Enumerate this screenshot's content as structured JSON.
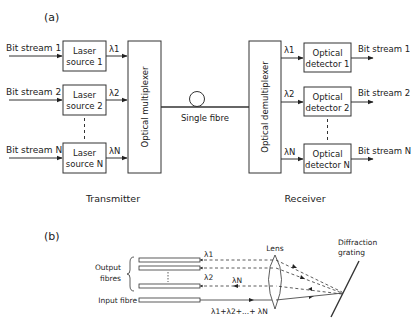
{
  "part_a": {
    "label": "(a)",
    "transmitter": {
      "caption": "Transmitter",
      "inputs": [
        "Bit stream 1",
        "Bit stream 2",
        "Bit stream N"
      ],
      "sources": [
        {
          "line1": "Laser",
          "line2": "source 1",
          "wavelength": "λ1"
        },
        {
          "line1": "Laser",
          "line2": "source 2",
          "wavelength": "λ2"
        },
        {
          "line1": "Laser",
          "line2": "source N",
          "wavelength": "λN"
        }
      ],
      "multiplexer": "Optical multiplexer"
    },
    "link": {
      "label": "Single fibre"
    },
    "receiver": {
      "caption": "Receiver",
      "demultiplexer": "Optical demultiplexer",
      "detectors": [
        {
          "line1": "Optical",
          "line2": "detector 1",
          "wavelength": "λ1"
        },
        {
          "line1": "Optical",
          "line2": "detector 2",
          "wavelength": "λ2"
        },
        {
          "line1": "Optical",
          "line2": "detector N",
          "wavelength": "λN"
        }
      ],
      "outputs": [
        "Bit stream 1",
        "Bit stream 2",
        "Bit stream N"
      ]
    }
  },
  "part_b": {
    "label": "(b)",
    "output_fibres": "Output fibres",
    "output_fibres_line1": "Output",
    "output_fibres_line2": "fibres",
    "input_fibre": "Input fibre",
    "lens": "Lens",
    "grating_line1": "Diffraction",
    "grating_line2": "grating",
    "lambda1": "λ1",
    "lambda2": "λ2",
    "lambdaN": "λN",
    "sum": "λ1+λ2+...+ λN"
  }
}
